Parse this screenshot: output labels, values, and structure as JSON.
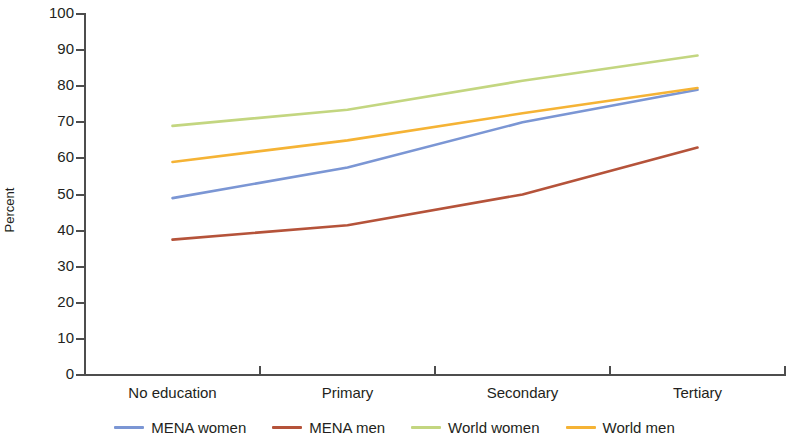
{
  "chart_data": {
    "type": "line",
    "title": "",
    "xlabel": "",
    "ylabel": "Percent",
    "categories": [
      "No education",
      "Primary",
      "Secondary",
      "Tertiary"
    ],
    "ylim": [
      0,
      100
    ],
    "ytick_step": 10,
    "yticks": [
      0,
      10,
      20,
      30,
      40,
      50,
      60,
      70,
      80,
      90,
      100
    ],
    "ytick_labels": [
      "0",
      "10",
      "20",
      "30",
      "40",
      "50",
      "60",
      "70",
      "80",
      "90",
      "100"
    ],
    "grid": false,
    "legend_position": "bottom",
    "series": [
      {
        "name": "MENA women",
        "color": "#7b96d4",
        "values": [
          49,
          57.5,
          70,
          79
        ]
      },
      {
        "name": "MENA men",
        "color": "#b5533a",
        "values": [
          37.5,
          41.5,
          50,
          63
        ]
      },
      {
        "name": "World women",
        "color": "#c3d680",
        "values": [
          69,
          73.5,
          81.5,
          88.5
        ]
      },
      {
        "name": "World men",
        "color": "#f5b335",
        "values": [
          59,
          65,
          72.5,
          79.5
        ]
      }
    ]
  },
  "axis": {
    "y_title": "Percent"
  },
  "legend": {
    "items": [
      {
        "label": "MENA women",
        "color": "#7b96d4"
      },
      {
        "label": "MENA men",
        "color": "#b5533a"
      },
      {
        "label": "World women",
        "color": "#c3d680"
      },
      {
        "label": "World men",
        "color": "#f5b335"
      }
    ]
  }
}
